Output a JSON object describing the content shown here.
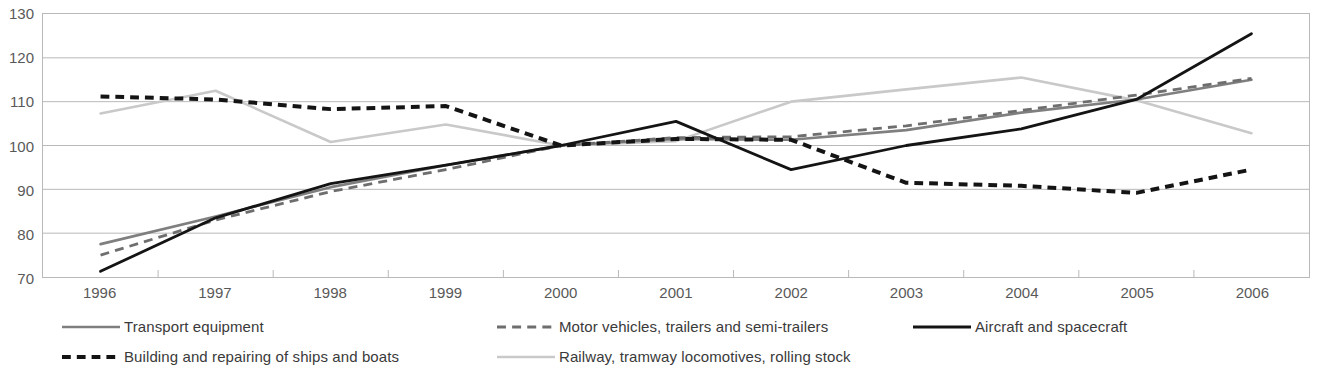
{
  "chart_data": {
    "type": "line",
    "title": "",
    "subtitle": "",
    "xlabel": "",
    "ylabel": "",
    "grid": true,
    "legend_position": "bottom",
    "x": [
      "1996",
      "1997",
      "1998",
      "1999",
      "2000",
      "2001",
      "2002",
      "2003",
      "2004",
      "2005",
      "2006"
    ],
    "categories": [
      "1996",
      "1997",
      "1998",
      "1999",
      "2000",
      "2001",
      "2002",
      "2003",
      "2004",
      "2005",
      "2006"
    ],
    "ylim": [
      70,
      130
    ],
    "yticks": [
      70,
      80,
      90,
      100,
      110,
      120,
      130
    ],
    "ytick_labels": [
      "70",
      "80",
      "90",
      "100",
      "110",
      "120",
      "130"
    ],
    "series": [
      {
        "name": "Transport equipment",
        "style": "solid",
        "color": "#7f7f7f",
        "width": 2.6,
        "values": [
          77.5,
          83.8,
          90.5,
          95.5,
          100.0,
          101.5,
          101.3,
          103.5,
          107.5,
          110.5,
          115.0
        ]
      },
      {
        "name": "Motor vehicles, trailers and semi-trailers",
        "style": "dashed",
        "color": "#6e6e6e",
        "width": 2.8,
        "values": [
          75.0,
          83.0,
          89.5,
          94.5,
          100.0,
          101.8,
          102.0,
          104.5,
          108.0,
          111.5,
          115.3
        ]
      },
      {
        "name": "Aircraft and spacecraft",
        "style": "solid",
        "color": "#141414",
        "width": 2.8,
        "values": [
          71.3,
          83.5,
          91.3,
          95.5,
          100.0,
          105.5,
          94.5,
          100.0,
          103.8,
          110.5,
          125.5
        ]
      },
      {
        "name": "Building and repairing of ships and boats",
        "style": "dotted-thick",
        "color": "#141414",
        "width": 4.0,
        "values": [
          111.2,
          110.5,
          108.3,
          109.0,
          100.0,
          101.5,
          101.3,
          91.5,
          90.8,
          89.2,
          94.5
        ]
      },
      {
        "name": "Railway, tramway locomotives, rolling stock",
        "style": "solid",
        "color": "#c9c9c9",
        "width": 2.6,
        "values": [
          107.3,
          112.5,
          100.8,
          104.8,
          100.0,
          101.0,
          110.0,
          112.8,
          115.5,
          110.3,
          102.8
        ]
      }
    ],
    "axis": {
      "y_tick_labels": [
        "130",
        "120",
        "110",
        "100",
        "90",
        "80",
        "70"
      ],
      "x_tick_labels": [
        "1996",
        "1997",
        "1998",
        "1999",
        "2000",
        "2001",
        "2002",
        "2003",
        "2004",
        "2005",
        "2006"
      ]
    },
    "legend": [
      {
        "label": "Transport equipment",
        "style": "solid",
        "color": "#7f7f7f",
        "width": 2.6
      },
      {
        "label": "Motor vehicles, trailers and semi-trailers",
        "style": "dashed",
        "color": "#6e6e6e",
        "width": 2.8
      },
      {
        "label": "Aircraft and spacecraft",
        "style": "solid",
        "color": "#141414",
        "width": 2.8
      },
      {
        "label": "Building and repairing of ships and boats",
        "style": "dotted-thick",
        "color": "#141414",
        "width": 4.0
      },
      {
        "label": "Railway, tramway locomotives, rolling stock",
        "style": "solid",
        "color": "#c9c9c9",
        "width": 2.6
      }
    ],
    "colors": {
      "grid": "#b9b9b9",
      "frame": "#b9b9b9",
      "text": "#595959",
      "background": "#ffffff"
    }
  }
}
